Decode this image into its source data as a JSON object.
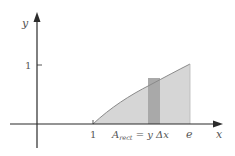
{
  "diagram": {
    "title": "",
    "axes": {
      "x_label": "x",
      "y_label": "y",
      "y_tick_label": "1",
      "x_tick_labels": [
        "1",
        "e"
      ]
    },
    "curve": {
      "function": "y = ln x",
      "domain": [
        "1",
        "e"
      ]
    },
    "rectangle_label": {
      "main": "A",
      "subscript": "rect",
      "rest": " = y Δx"
    },
    "colors": {
      "axis": "#2b2b2b",
      "region_fill": "#d6d6d6",
      "rect_fill": "#a9a9a9",
      "curve": "#8a8a8a",
      "text": "#555555"
    }
  }
}
